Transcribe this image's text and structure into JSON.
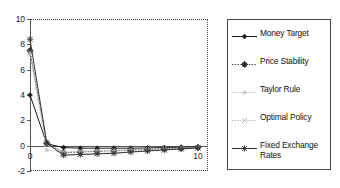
{
  "chart_data": {
    "type": "line",
    "title": "",
    "xlabel": "",
    "ylabel": "",
    "xlim": [
      0,
      10.6
    ],
    "ylim": [
      -2,
      10
    ],
    "grid": false,
    "legend_position": "right",
    "y_ticks": [
      {
        "value": 10,
        "label": "10"
      },
      {
        "value": 8,
        "label": "8"
      },
      {
        "value": 6,
        "label": "6"
      },
      {
        "value": 4,
        "label": "4"
      },
      {
        "value": 2,
        "label": "2"
      },
      {
        "value": 0,
        "label": "0"
      },
      {
        "value": -2,
        "label": "-2"
      }
    ],
    "x_ticks": [
      {
        "value": 0,
        "label": "0"
      },
      {
        "value": 10,
        "label": "10"
      }
    ],
    "x": [
      0,
      1,
      2,
      3,
      4,
      5,
      6,
      7,
      8,
      9,
      10
    ],
    "series": [
      {
        "name": "Money Target",
        "marker": "diamond",
        "line_style": "solid",
        "color": "#1a1a1a",
        "values": [
          4.0,
          0.15,
          -0.15,
          -0.2,
          -0.2,
          -0.2,
          -0.2,
          -0.18,
          -0.15,
          -0.12,
          -0.1
        ]
      },
      {
        "name": "Price Stability",
        "marker": "circle-cross",
        "line_style": "dotted",
        "color": "#2b2b2b",
        "values": [
          7.5,
          0.2,
          -0.55,
          -0.5,
          -0.45,
          -0.4,
          -0.35,
          -0.3,
          -0.25,
          -0.2,
          -0.15
        ]
      },
      {
        "name": "Taylor Rule",
        "marker": "star",
        "line_style": "dotted",
        "color": "#b8b8b8",
        "values": [
          7.2,
          -0.35,
          -0.5,
          -0.45,
          -0.4,
          -0.38,
          -0.32,
          -0.28,
          -0.22,
          -0.18,
          -0.14
        ]
      },
      {
        "name": "Optimal Policy",
        "marker": "cross",
        "line_style": "dotted",
        "color": "#b0b0b0",
        "values": [
          7.4,
          0.1,
          -0.72,
          -0.68,
          -0.62,
          -0.55,
          -0.48,
          -0.4,
          -0.33,
          -0.26,
          -0.2
        ]
      },
      {
        "name": "Fixed Exchange Rates",
        "marker": "asterisk",
        "line_style": "solid",
        "color": "#333333",
        "values": [
          8.4,
          0.2,
          -0.75,
          -0.7,
          -0.65,
          -0.6,
          -0.5,
          -0.42,
          -0.34,
          -0.26,
          -0.18
        ]
      }
    ]
  },
  "legend": {
    "items": [
      {
        "label": "Money Target"
      },
      {
        "label": "Price Stability"
      },
      {
        "label": "Taylor Rule"
      },
      {
        "label": "Optimal Policy"
      },
      {
        "label": "Fixed Exchange\nRates"
      }
    ]
  }
}
